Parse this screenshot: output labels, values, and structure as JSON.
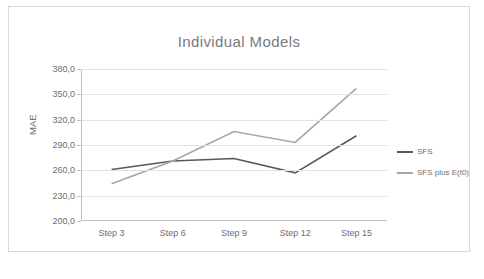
{
  "chart_data": {
    "type": "line",
    "title": "Individual Models",
    "xlabel": "",
    "ylabel": "MAE",
    "categories": [
      "Step 3",
      "Step 6",
      "Step 9",
      "Step 12",
      "Step 15"
    ],
    "series": [
      {
        "name": "SFS",
        "values": [
          261,
          271,
          274,
          257,
          301
        ],
        "color": "#595959"
      },
      {
        "name": "SFS plus E(t0)",
        "values": [
          244,
          271,
          306,
          293,
          357
        ],
        "color": "#a6a6a6"
      }
    ],
    "ylim": [
      200,
      380
    ],
    "yticks": [
      "200,0",
      "230,0",
      "260,0",
      "290,0",
      "320,0",
      "350,0",
      "380,0"
    ],
    "ytick_values": [
      200,
      230,
      260,
      290,
      320,
      350,
      380
    ],
    "grid": true,
    "legend_position": "right"
  },
  "legend": {
    "items": [
      {
        "label": "SFS",
        "color": "#595959"
      },
      {
        "label": "SFS plus E(t0)",
        "color": "#a6a6a6"
      }
    ]
  }
}
